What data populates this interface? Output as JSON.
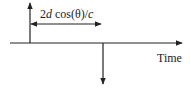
{
  "diagram": {
    "delay_label": {
      "prefix": "2",
      "var_d": "d",
      "middle": " cos(θ)/",
      "var_c": "c"
    },
    "axis_label": "Time",
    "colors": {
      "line": "#222222",
      "background": "#ffffff"
    },
    "elements": [
      {
        "type": "axis",
        "direction": "horizontal",
        "label": "Time"
      },
      {
        "type": "impulse",
        "direction": "up",
        "position": "start"
      },
      {
        "type": "impulse",
        "direction": "down",
        "position": "delayed"
      },
      {
        "type": "double-arrow",
        "meaning": "delay interval",
        "label": "2d cos(θ)/c"
      }
    ]
  }
}
